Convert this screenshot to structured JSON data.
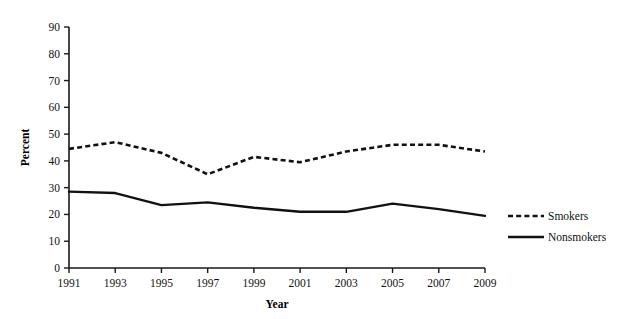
{
  "chart_data": {
    "type": "line",
    "title": "",
    "xlabel": "Year",
    "ylabel": "Percent",
    "x": [
      1991,
      1993,
      1995,
      1997,
      1999,
      2001,
      2003,
      2005,
      2007,
      2009
    ],
    "categories": [
      "1991",
      "1993",
      "1995",
      "1997",
      "1999",
      "2001",
      "2003",
      "2005",
      "2007",
      "2009"
    ],
    "xtick_labels": [
      "1991",
      "1993",
      "1995",
      "1997",
      "1999",
      "2001",
      "2003",
      "2005",
      "2007",
      "2009"
    ],
    "ytick_labels": [
      "0",
      "10",
      "20",
      "30",
      "40",
      "50",
      "60",
      "70",
      "80",
      "90"
    ],
    "yticks": [
      0,
      10,
      20,
      30,
      40,
      50,
      60,
      70,
      80,
      90
    ],
    "ylim": [
      0,
      90
    ],
    "xlim": [
      1991,
      2009
    ],
    "grid": false,
    "legend_position": "right",
    "series": [
      {
        "name": "Smokers",
        "style": "dashed",
        "color": "#111111",
        "values": [
          44.5,
          47.0,
          43.0,
          35.0,
          41.5,
          39.5,
          43.5,
          46.0,
          46.0,
          43.5
        ]
      },
      {
        "name": "Nonsmokers",
        "style": "solid",
        "color": "#111111",
        "values": [
          28.5,
          28.0,
          23.5,
          24.5,
          22.5,
          21.0,
          21.0,
          24.0,
          22.0,
          19.5
        ]
      }
    ]
  },
  "legend": {
    "items": [
      {
        "label": "Smokers",
        "style": "dashed"
      },
      {
        "label": "Nonsmokers",
        "style": "solid"
      }
    ]
  }
}
